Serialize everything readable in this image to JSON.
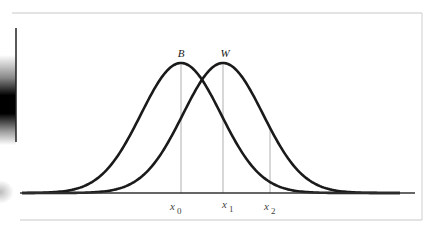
{
  "figure": {
    "type": "two-overlapping-normal-curves",
    "curves": [
      {
        "label": "B",
        "peak_label_x": 181,
        "center_x": 181,
        "sigma_px": 40
      },
      {
        "label": "W",
        "peak_label_x": 224,
        "center_x": 223,
        "sigma_px": 40
      }
    ],
    "markers": [
      {
        "label_base": "x",
        "label_sub": "0",
        "x": 181
      },
      {
        "label_base": "x",
        "label_sub": "1",
        "x": 223
      },
      {
        "label_base": "x",
        "label_sub": "2",
        "x": 270
      }
    ],
    "colors": {
      "curve": "#1a1a1a",
      "marker_line": "#b0b0b0",
      "baseline": "#333333",
      "frame": "#c8c8c8"
    }
  }
}
